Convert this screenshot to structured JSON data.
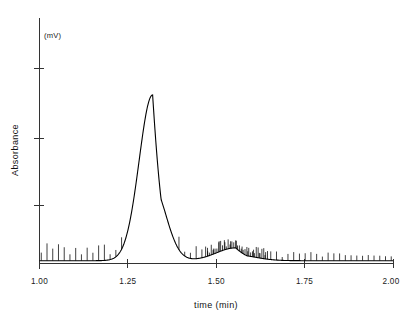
{
  "chart_data": {
    "type": "line",
    "title": "",
    "subtitle": "",
    "xlabel": "time (min)",
    "ylabel": "Absorbance",
    "y_unit_label": "(mV)",
    "xlim": [
      1.0,
      2.0
    ],
    "ylim": [
      0,
      1.0
    ],
    "grid": false,
    "legend": null,
    "x_tick_labels": [
      "1.00",
      "1.25",
      "1.50",
      "1.75",
      "2.00"
    ],
    "x_tick_values": [
      1.0,
      1.25,
      1.5,
      1.75,
      2.0
    ],
    "y_tick_labels": [
      "",
      "",
      ""
    ],
    "y_tick_values": [
      0.25,
      0.5,
      0.78
    ],
    "annotations": [],
    "peaks": [
      {
        "name": "main-peak",
        "center": 1.32,
        "height": 0.71,
        "width": 0.038,
        "tail": 0.03
      },
      {
        "name": "minor-hump",
        "center": 1.555,
        "height": 0.055,
        "width": 0.055,
        "tail": 0.04
      }
    ],
    "baseline": 0.012,
    "noise": {
      "kind": "periodic-spikes",
      "start": 1.005,
      "end": 1.995,
      "count": 62,
      "amplitude_left": 0.055,
      "amplitude_right": 0.02
    },
    "series": [
      {
        "name": "chromatogram",
        "color": "#000000",
        "x": [
          1.0,
          1.05,
          1.1,
          1.15,
          1.2,
          1.24,
          1.26,
          1.28,
          1.3,
          1.32,
          1.34,
          1.36,
          1.38,
          1.4,
          1.44,
          1.48,
          1.52,
          1.55,
          1.58,
          1.62,
          1.66,
          1.7,
          1.75,
          1.8,
          1.85,
          1.9,
          1.95,
          2.0
        ],
        "y": [
          0.012,
          0.012,
          0.013,
          0.013,
          0.016,
          0.055,
          0.17,
          0.43,
          0.66,
          0.71,
          0.6,
          0.35,
          0.16,
          0.07,
          0.022,
          0.018,
          0.04,
          0.058,
          0.046,
          0.022,
          0.015,
          0.013,
          0.012,
          0.011,
          0.011,
          0.01,
          0.01,
          0.01
        ]
      }
    ]
  },
  "axes": {
    "x_axis_name": "time-axis",
    "y_axis_name": "absorbance-axis"
  }
}
